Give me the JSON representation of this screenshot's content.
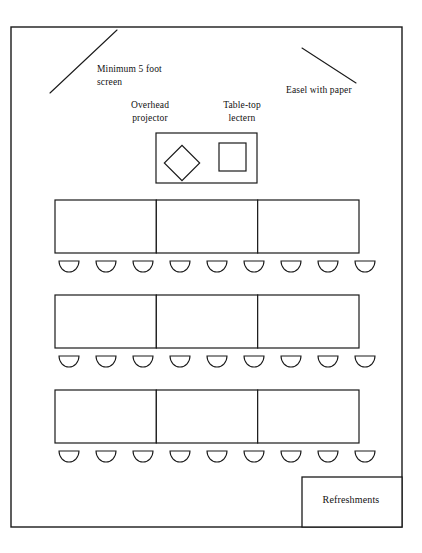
{
  "diagram": {
    "type": "floor-plan",
    "canvas": {
      "width": 422,
      "height": 553
    },
    "stroke_color": "#1a1a1a",
    "fill_color": "#ffffff"
  },
  "labels": {
    "screen": "Minimum 5 foot\nscreen",
    "easel": "Easel with paper",
    "projector": "Overhead\nprojector",
    "lectern": "Table-top\nlectern",
    "refreshments": "Refreshments"
  },
  "room": {
    "name": "room-outline",
    "x": 11,
    "y": 27,
    "width": 391,
    "height": 500
  },
  "fixtures": {
    "screen_line": {
      "x1": 50,
      "y1": 93,
      "x2": 117,
      "y2": 30
    },
    "easel_line": {
      "x1": 302,
      "y1": 48,
      "x2": 356,
      "y2": 83
    },
    "head_table": {
      "x": 156,
      "y": 133,
      "width": 101,
      "height": 50
    },
    "projector_diamond": {
      "cx": 182,
      "cy": 163,
      "size": 25,
      "rotation": 45
    },
    "lectern_square": {
      "x": 219,
      "y": 143,
      "width": 27,
      "height": 28
    }
  },
  "seating": {
    "rows": [
      {
        "name": "row-1",
        "table_y": 200,
        "chair_y": 261
      },
      {
        "name": "row-2",
        "table_y": 295,
        "chair_y": 356
      },
      {
        "name": "row-3",
        "table_y": 390,
        "chair_y": 451
      }
    ],
    "table_x": 55,
    "table_width": 304,
    "table_height": 53,
    "segments_per_row": 3,
    "chairs_per_row": 9,
    "chair_width": 20,
    "chair_height": 11,
    "chair_first_x": 59,
    "chair_pitch": 37,
    "total_tables": 9,
    "total_chairs": 27
  },
  "refreshments_table": {
    "x": 302,
    "y": 477,
    "width": 100,
    "height": 50
  }
}
